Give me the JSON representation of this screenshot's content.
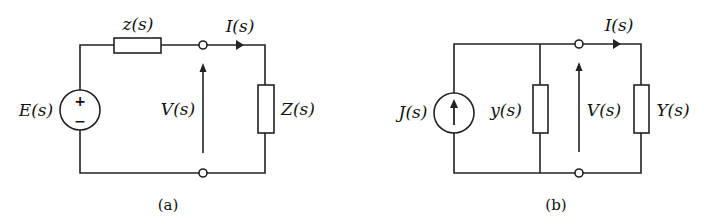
{
  "figure": {
    "circuit_a": {
      "caption": "(a)",
      "source_label": "E(s)",
      "source_type": "voltage-source",
      "source_plus": "+",
      "source_minus": "−",
      "series_impedance_label": "z(s)",
      "current_label": "I(s)",
      "voltage_label": "V(s)",
      "load_label": "Z(s)"
    },
    "circuit_b": {
      "caption": "(b)",
      "source_label": "J(s)",
      "source_type": "current-source",
      "shunt_admittance_label": "y(s)",
      "current_label": "I(s)",
      "voltage_label": "V(s)",
      "load_label": "Y(s)"
    }
  }
}
